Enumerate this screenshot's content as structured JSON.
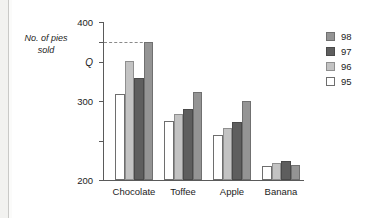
{
  "chart_data": {
    "type": "bar",
    "title": "",
    "xlabel": "",
    "ylabel": "No. of pies sold",
    "categories": [
      "Chocolate",
      "Toffee",
      "Apple",
      "Banana"
    ],
    "series": [
      {
        "name": "95",
        "values": [
          218,
          150,
          113,
          35
        ],
        "color": "#ffffff"
      },
      {
        "name": "96",
        "values": [
          302,
          168,
          132,
          42
        ],
        "color": "#c3c3c3"
      },
      {
        "name": "97",
        "values": [
          258,
          180,
          147,
          48
        ],
        "color": "#5e5e5e"
      },
      {
        "name": "98",
        "values": [
          350,
          222,
          200,
          37
        ],
        "color": "#949494"
      }
    ],
    "ylim": [
      0,
      400
    ],
    "yticks": [
      0,
      100,
      200,
      300,
      400
    ],
    "ytick_labels": [
      "0",
      "100",
      "200",
      "300",
      "400"
    ],
    "grid": false,
    "legend_position": "right",
    "legend_order": [
      "98",
      "97",
      "96",
      "95"
    ],
    "annotations": [
      {
        "label": "Q",
        "value": 350,
        "style": "dashed-horizontal-line",
        "note": "dashed line from y-axis to top of the 98 Chocolate bar"
      }
    ]
  },
  "axis": {
    "y_title_line1": "No. of pies",
    "y_title_line2": "sold",
    "q_label": "Q"
  },
  "colors": {
    "axis": "#5a5a5a",
    "text": "#1c1c1c",
    "dash": "#8a8a8a",
    "page_edge": "#f2f2f0"
  }
}
